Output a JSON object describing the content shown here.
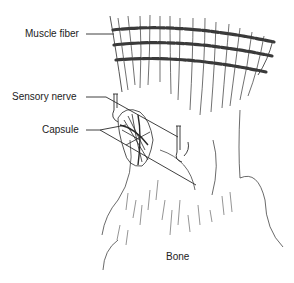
{
  "diagram": {
    "labels": [
      {
        "id": "muscle-fiber",
        "text": "Muscle fiber",
        "x": 25,
        "y": 28
      },
      {
        "id": "sensory-nerve",
        "text": "Sensory nerve",
        "x": 12,
        "y": 91
      },
      {
        "id": "capsule",
        "text": "Capsule",
        "x": 42,
        "y": 124
      },
      {
        "id": "bone",
        "text": "Bone",
        "x": 166,
        "y": 251
      }
    ],
    "colors": {
      "line": "#2a2a2a",
      "band": "#3a3a3a",
      "text": "#222222",
      "background": "#ffffff"
    }
  }
}
